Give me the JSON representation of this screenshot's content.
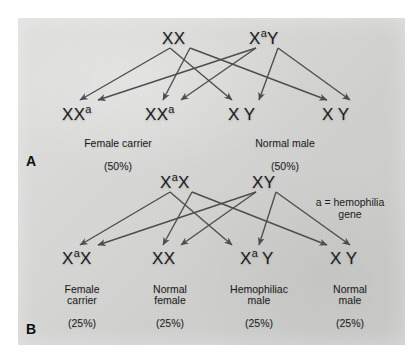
{
  "figure": {
    "background_color": "#d6d6d5",
    "ink_color": "#1b1b1b",
    "arrow_color": "#4d4d4d"
  },
  "legend": {
    "text": "a = hemophilia\ngene"
  },
  "panels": [
    {
      "letter": "A",
      "parents": [
        {
          "name": "mother",
          "symbol": "XX",
          "allele1": "X",
          "allele2": "X",
          "sup1": "",
          "sup2": ""
        },
        {
          "name": "father",
          "symbol": "XaY",
          "allele1": "X",
          "allele2": "Y",
          "sup1": "a",
          "sup2": ""
        }
      ],
      "offspring": [
        {
          "genotype": "XXa",
          "label": "Female carrier",
          "percent": "(50%)"
        },
        {
          "genotype": "XXa",
          "label": "",
          "percent": ""
        },
        {
          "genotype": "X Y",
          "label": "Normal male",
          "percent": "(50%)"
        },
        {
          "genotype": "X Y",
          "label": "",
          "percent": ""
        }
      ],
      "group_captions": [
        {
          "label": "Female carrier",
          "percent": "(50%)"
        },
        {
          "label": "Normal male",
          "percent": "(50%)"
        }
      ]
    },
    {
      "letter": "B",
      "parents": [
        {
          "name": "mother",
          "symbol": "XaX",
          "allele1": "X",
          "allele2": "X",
          "sup1": "a",
          "sup2": ""
        },
        {
          "name": "father",
          "symbol": "XY",
          "allele1": "X",
          "allele2": "Y",
          "sup1": "",
          "sup2": ""
        }
      ],
      "offspring": [
        {
          "genotype": "XaX",
          "label": "Female\ncarrier",
          "percent": "(25%)"
        },
        {
          "genotype": "XX",
          "label": "Normal\nfemale",
          "percent": "(25%)"
        },
        {
          "genotype": "Xa Y",
          "label": "Hemophiliac\nmale",
          "percent": "(25%)"
        },
        {
          "genotype": "X Y",
          "label": "Normal\nmale",
          "percent": "(25%)"
        }
      ]
    }
  ]
}
